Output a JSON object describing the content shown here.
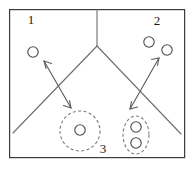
{
  "figure": {
    "title": "",
    "width": 194,
    "height": 171,
    "background_color": "#ffffff",
    "frame": {
      "x": 9,
      "y": 9,
      "width": 176,
      "height": 149,
      "stroke_color": "#3b3b3b"
    },
    "region_labels": [
      {
        "id": "region-1",
        "text": "1",
        "x": 31,
        "y": 21
      },
      {
        "id": "region-2",
        "text": "2",
        "x": 157,
        "y": 22
      },
      {
        "id": "region-3",
        "text": "3",
        "x": 103,
        "y": 150
      }
    ],
    "partition_lines": {
      "stroke_color": "#6e6e6e",
      "apex": {
        "x": 97,
        "y": 46
      },
      "segments": [
        {
          "name": "vertical-divider",
          "x1": 97,
          "y1": 9,
          "x2": 97,
          "y2": 46
        },
        {
          "name": "left-diagonal-divider",
          "x1": 97,
          "y1": 46,
          "x2": 13,
          "y2": 133
        },
        {
          "name": "right-diagonal-divider",
          "x1": 97,
          "y1": 46,
          "x2": 181,
          "y2": 134
        }
      ]
    },
    "nodes": [
      {
        "name": "node-region1-a",
        "cx": 33,
        "cy": 52,
        "r": 5.2,
        "region": "1"
      },
      {
        "name": "node-region2-a",
        "cx": 149,
        "cy": 42,
        "r": 5.2,
        "region": "2"
      },
      {
        "name": "node-region2-b",
        "cx": 167,
        "cy": 50,
        "r": 5.2,
        "region": "2"
      },
      {
        "name": "node-cluster-left-a",
        "cx": 80,
        "cy": 130,
        "r": 5.2,
        "region": "3"
      },
      {
        "name": "node-cluster-right-a",
        "cx": 136,
        "cy": 127,
        "r": 5.2,
        "region": "3"
      },
      {
        "name": "node-cluster-right-b",
        "cx": 136,
        "cy": 143,
        "r": 5.2,
        "region": "3"
      }
    ],
    "clusters": [
      {
        "name": "cluster-left",
        "shape": "circle",
        "cx": 80,
        "cy": 131,
        "rx": 20,
        "ry": 20,
        "stroke_color": "#7a7a7a",
        "dashed": true
      },
      {
        "name": "cluster-right",
        "shape": "ellipse",
        "cx": 136,
        "cy": 135,
        "rx": 13,
        "ry": 19,
        "stroke_color": "#7a7a7a",
        "dashed": true
      }
    ],
    "arrows": [
      {
        "name": "arrow-left-bidirectional",
        "x1": 44,
        "y1": 61,
        "x2": 71,
        "y2": 108,
        "double_headed": true,
        "stroke_color": "#5a5a5a"
      },
      {
        "name": "arrow-right-bidirectional",
        "x1": 159,
        "y1": 58,
        "x2": 130,
        "y2": 109,
        "double_headed": true,
        "stroke_color": "#5a5a5a"
      }
    ]
  }
}
